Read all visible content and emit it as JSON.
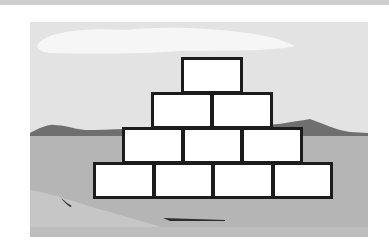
{
  "diagram": {
    "type": "pyramid",
    "rows": [
      {
        "row": 1,
        "box_count": 1,
        "boxes": [
          {
            "label": ""
          }
        ]
      },
      {
        "row": 2,
        "box_count": 2,
        "boxes": [
          {
            "label": ""
          },
          {
            "label": ""
          }
        ]
      },
      {
        "row": 3,
        "box_count": 3,
        "boxes": [
          {
            "label": ""
          },
          {
            "label": ""
          },
          {
            "label": ""
          }
        ]
      },
      {
        "row": 4,
        "box_count": 4,
        "boxes": [
          {
            "label": ""
          },
          {
            "label": ""
          },
          {
            "label": ""
          },
          {
            "label": ""
          }
        ]
      }
    ]
  },
  "colors": {
    "top_bar": "#cfcfcf",
    "sky": "#e3e3e3",
    "cloud": "#f6f6f6",
    "mountains": "#6f6f6f",
    "ground": "#b5b5b5",
    "shore": "#c9c9c9",
    "box_fill": "#ffffff",
    "box_border": "#1c1c1c"
  }
}
